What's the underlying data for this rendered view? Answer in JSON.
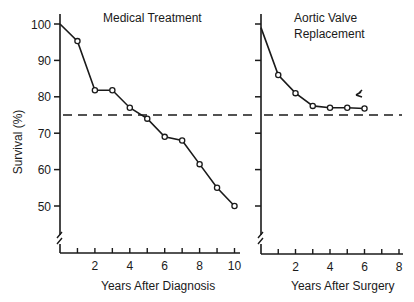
{
  "chart_data": [
    {
      "type": "line",
      "title": "Medical Treatment",
      "xlabel": "Years After Diagnosis",
      "ylabel": "Survival (%)",
      "x": [
        0,
        1,
        2,
        3,
        4,
        5,
        6,
        7,
        8,
        9,
        10
      ],
      "values": [
        100,
        95.3,
        81.8,
        81.8,
        77,
        74,
        69,
        68,
        61.5,
        55,
        50
      ],
      "reference_line": {
        "y": 75,
        "style": "dashed"
      },
      "xticks": [
        "2",
        "4",
        "6",
        "8",
        "10"
      ],
      "yticks": [
        "100",
        "90",
        "80",
        "70",
        "60",
        "50"
      ],
      "xlim": [
        0,
        10
      ],
      "ylim": [
        40,
        100
      ],
      "axis_break": true,
      "grid": false
    },
    {
      "type": "line",
      "title": "Aortic Valve Replacement",
      "xlabel": "Years After Surgery",
      "ylabel": "Survival (%)",
      "x": [
        0,
        1,
        2,
        3,
        4,
        5,
        6
      ],
      "values": [
        99,
        86,
        81,
        77.5,
        77,
        77,
        76.8
      ],
      "reference_line": {
        "y": 75,
        "style": "dashed"
      },
      "annotation": "arrow/marker near end of curve",
      "xticks": [
        "2",
        "4",
        "6",
        "8"
      ],
      "xlim": [
        0,
        8
      ],
      "ylim": [
        40,
        100
      ],
      "axis_break": true,
      "grid": false
    }
  ],
  "left": {
    "title": "Medical Treatment",
    "xlabel": "Years After Diagnosis",
    "ylabel": "Survival (%)",
    "yticks": [
      "100",
      "90",
      "80",
      "70",
      "60",
      "50"
    ],
    "xticks": [
      "2",
      "4",
      "6",
      "8",
      "10"
    ]
  },
  "right": {
    "title_line1": "Aortic Valve",
    "title_line2": "Replacement",
    "xlabel": "Years After Surgery",
    "xticks": [
      "2",
      "4",
      "6",
      "8"
    ]
  }
}
